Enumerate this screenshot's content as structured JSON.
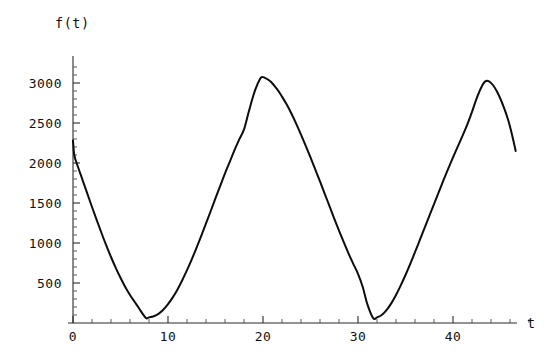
{
  "figure": {
    "background_color": "#ffffff",
    "curve_color": "#0d0d0d",
    "axis_color": "#2b2b2b",
    "ylabel": "f(t)",
    "xlabel": "t"
  },
  "chart_data": {
    "type": "line",
    "title": "",
    "subtitle": "",
    "xlabel": "t",
    "ylabel": "f(t)",
    "grid": false,
    "legend": false,
    "xlim": [
      0,
      48.5
    ],
    "ylim": [
      0,
      3280
    ],
    "x_ticks_major": [
      0,
      10,
      20,
      30,
      40
    ],
    "x_tick_labels": [
      "0",
      "10",
      "20",
      "30",
      "40"
    ],
    "x_ticks_minor": [
      2,
      4,
      6,
      8,
      12,
      14,
      16,
      18,
      22,
      24,
      26,
      28,
      32,
      34,
      36,
      38,
      42,
      44,
      46,
      48
    ],
    "y_ticks_major": [
      500,
      1000,
      1500,
      2000,
      2500,
      3000
    ],
    "y_tick_labels": [
      "500",
      "1000",
      "1500",
      "2000",
      "2500",
      "3000"
    ],
    "y_ticks_minor": [
      100,
      200,
      300,
      400,
      600,
      700,
      800,
      900,
      1100,
      1200,
      1300,
      1400,
      1600,
      1700,
      1800,
      1900,
      2100,
      2200,
      2300,
      2400,
      2600,
      2700,
      2800,
      2900,
      3100,
      3200
    ],
    "annotations": [
      {
        "name": "start-spike",
        "t": 0.0,
        "note": "curve starts near 2280 with a short near-vertical segment down to about 2090"
      },
      {
        "name": "first-minimum",
        "t": 7.7,
        "value": 60
      },
      {
        "name": "first-maximum",
        "t": 19.8,
        "value": 3070
      },
      {
        "name": "second-minimum",
        "t": 31.6,
        "value": 60
      },
      {
        "name": "second-maximum",
        "t": 43.4,
        "value": 3020
      },
      {
        "name": "curve-end",
        "t": 46.6,
        "value": 2150
      }
    ],
    "series": [
      {
        "name": "f(t)",
        "color": "#0d0d0d",
        "points": [
          [
            0.0,
            2280
          ],
          [
            0.15,
            2090
          ],
          [
            0.5,
            1960
          ],
          [
            1.0,
            1790
          ],
          [
            1.5,
            1620
          ],
          [
            2.0,
            1450
          ],
          [
            2.5,
            1285
          ],
          [
            3.0,
            1125
          ],
          [
            3.5,
            970
          ],
          [
            4.0,
            825
          ],
          [
            4.5,
            690
          ],
          [
            5.0,
            565
          ],
          [
            5.5,
            450
          ],
          [
            6.0,
            350
          ],
          [
            6.5,
            262
          ],
          [
            7.0,
            175
          ],
          [
            7.3,
            120
          ],
          [
            7.7,
            60
          ],
          [
            8.0,
            70
          ],
          [
            8.5,
            85
          ],
          [
            9.0,
            115
          ],
          [
            9.5,
            165
          ],
          [
            10.0,
            235
          ],
          [
            10.5,
            320
          ],
          [
            11.0,
            420
          ],
          [
            11.5,
            535
          ],
          [
            12.0,
            660
          ],
          [
            12.5,
            795
          ],
          [
            13.0,
            940
          ],
          [
            13.5,
            1090
          ],
          [
            14.0,
            1245
          ],
          [
            14.5,
            1400
          ],
          [
            15.0,
            1560
          ],
          [
            15.5,
            1715
          ],
          [
            16.0,
            1870
          ],
          [
            16.5,
            2015
          ],
          [
            17.0,
            2160
          ],
          [
            17.5,
            2295
          ],
          [
            18.0,
            2420
          ],
          [
            18.5,
            2640
          ],
          [
            19.0,
            2850
          ],
          [
            19.4,
            2980
          ],
          [
            19.8,
            3070
          ],
          [
            20.2,
            3065
          ],
          [
            20.8,
            3020
          ],
          [
            21.5,
            2920
          ],
          [
            22.0,
            2830
          ],
          [
            22.5,
            2730
          ],
          [
            23.0,
            2615
          ],
          [
            23.5,
            2490
          ],
          [
            24.0,
            2355
          ],
          [
            24.5,
            2215
          ],
          [
            25.0,
            2070
          ],
          [
            25.5,
            1920
          ],
          [
            26.0,
            1770
          ],
          [
            26.5,
            1615
          ],
          [
            27.0,
            1460
          ],
          [
            27.5,
            1305
          ],
          [
            28.0,
            1155
          ],
          [
            28.5,
            1010
          ],
          [
            29.0,
            870
          ],
          [
            29.5,
            740
          ],
          [
            30.0,
            615
          ],
          [
            30.5,
            450
          ],
          [
            31.0,
            230
          ],
          [
            31.6,
            60
          ],
          [
            32.0,
            70
          ],
          [
            32.5,
            100
          ],
          [
            33.0,
            160
          ],
          [
            33.5,
            245
          ],
          [
            34.0,
            350
          ],
          [
            34.5,
            470
          ],
          [
            35.0,
            600
          ],
          [
            35.5,
            740
          ],
          [
            36.0,
            885
          ],
          [
            36.5,
            1035
          ],
          [
            37.0,
            1185
          ],
          [
            37.5,
            1335
          ],
          [
            38.0,
            1485
          ],
          [
            38.5,
            1635
          ],
          [
            39.0,
            1785
          ],
          [
            39.5,
            1930
          ],
          [
            40.0,
            2070
          ],
          [
            40.5,
            2205
          ],
          [
            41.0,
            2340
          ],
          [
            41.5,
            2480
          ],
          [
            42.0,
            2640
          ],
          [
            42.5,
            2810
          ],
          [
            43.0,
            2950
          ],
          [
            43.4,
            3020
          ],
          [
            43.8,
            3020
          ],
          [
            44.2,
            2975
          ],
          [
            44.6,
            2900
          ],
          [
            45.0,
            2800
          ],
          [
            45.4,
            2680
          ],
          [
            45.8,
            2540
          ],
          [
            46.2,
            2360
          ],
          [
            46.6,
            2150
          ]
        ]
      }
    ]
  }
}
